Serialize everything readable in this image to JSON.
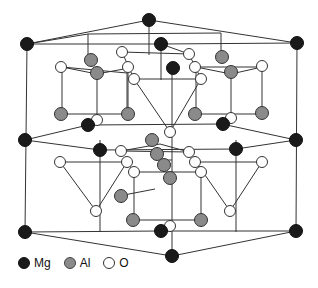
{
  "colors": {
    "Mg": "#1a1a1a",
    "Al": "#8a8a8a",
    "O": "#ffffff",
    "bond": "#333333",
    "outline": "#333333"
  },
  "legend": [
    {
      "key": "Mg",
      "label": "Mg"
    },
    {
      "key": "Al",
      "label": "Al"
    },
    {
      "key": "O",
      "label": "O"
    }
  ],
  "lines": [
    [
      27,
      44,
      149,
      20
    ],
    [
      149,
      20,
      297,
      43
    ],
    [
      27,
      44,
      161,
      44
    ],
    [
      161,
      44,
      297,
      43
    ],
    [
      27,
      44,
      25,
      232
    ],
    [
      297,
      43,
      296,
      231
    ],
    [
      149,
      20,
      149,
      55
    ],
    [
      161,
      44,
      161,
      80
    ],
    [
      27,
      44,
      88,
      34
    ],
    [
      88,
      34,
      88,
      60
    ],
    [
      88,
      34,
      221,
      33
    ],
    [
      221,
      33,
      221,
      55
    ],
    [
      161,
      44,
      189,
      54
    ],
    [
      25,
      232,
      172,
      256
    ],
    [
      172,
      256,
      296,
      231
    ],
    [
      25,
      232,
      161,
      231
    ],
    [
      161,
      231,
      296,
      231
    ],
    [
      172,
      256,
      172,
      140
    ],
    [
      25,
      140,
      88,
      125
    ],
    [
      88,
      125,
      222,
      124
    ],
    [
      222,
      124,
      296,
      140
    ],
    [
      25,
      140,
      100,
      150
    ],
    [
      100,
      150,
      236,
      149
    ],
    [
      236,
      149,
      296,
      140
    ],
    [
      100,
      140,
      100,
      232
    ],
    [
      236,
      140,
      236,
      232
    ],
    [
      62,
      67,
      97,
      74
    ],
    [
      97,
      74,
      129,
      68
    ],
    [
      62,
      67,
      127,
      73
    ],
    [
      62,
      67,
      62,
      114
    ],
    [
      62,
      114,
      127,
      114
    ],
    [
      127,
      73,
      127,
      114
    ],
    [
      97,
      74,
      97,
      120
    ],
    [
      128,
      68,
      128,
      114
    ],
    [
      196,
      67,
      231,
      74
    ],
    [
      231,
      74,
      262,
      67
    ],
    [
      196,
      67,
      262,
      67
    ],
    [
      262,
      67,
      262,
      114
    ],
    [
      196,
      67,
      196,
      114
    ],
    [
      196,
      114,
      262,
      114
    ],
    [
      231,
      74,
      231,
      118
    ],
    [
      134,
      79,
      201,
      79
    ],
    [
      134,
      79,
      170,
      132
    ],
    [
      201,
      79,
      170,
      132
    ],
    [
      172,
      70,
      172,
      140
    ],
    [
      122,
      52,
      189,
      54
    ],
    [
      122,
      52,
      134,
      79
    ],
    [
      189,
      54,
      201,
      79
    ],
    [
      60,
      162,
      127,
      162
    ],
    [
      60,
      162,
      96,
      211
    ],
    [
      127,
      162,
      96,
      211
    ],
    [
      127,
      162,
      134,
      172
    ],
    [
      196,
      162,
      262,
      162
    ],
    [
      196,
      162,
      230,
      211
    ],
    [
      262,
      162,
      230,
      211
    ],
    [
      196,
      162,
      201,
      172
    ],
    [
      134,
      172,
      201,
      172
    ],
    [
      134,
      172,
      134,
      220
    ],
    [
      201,
      172,
      201,
      220
    ],
    [
      134,
      220,
      201,
      220
    ],
    [
      121,
      151,
      189,
      152
    ],
    [
      121,
      151,
      160,
      144
    ],
    [
      160,
      144,
      189,
      152
    ],
    [
      161,
      160,
      172,
      160
    ],
    [
      155,
      189,
      124,
      195
    ]
  ],
  "atoms": [
    {
      "t": "Mg",
      "x": 149,
      "y": 20
    },
    {
      "t": "Mg",
      "x": 27,
      "y": 44
    },
    {
      "t": "Mg",
      "x": 161,
      "y": 44
    },
    {
      "t": "Mg",
      "x": 297,
      "y": 43
    },
    {
      "t": "Al",
      "x": 91,
      "y": 60
    },
    {
      "t": "Al",
      "x": 222,
      "y": 57
    },
    {
      "t": "O",
      "x": 122,
      "y": 52
    },
    {
      "t": "O",
      "x": 189,
      "y": 54
    },
    {
      "t": "O",
      "x": 61,
      "y": 67
    },
    {
      "t": "O",
      "x": 128,
      "y": 67
    },
    {
      "t": "O",
      "x": 195,
      "y": 67
    },
    {
      "t": "O",
      "x": 262,
      "y": 66
    },
    {
      "t": "Mg",
      "x": 173,
      "y": 68
    },
    {
      "t": "Al",
      "x": 97,
      "y": 73
    },
    {
      "t": "Al",
      "x": 231,
      "y": 72
    },
    {
      "t": "O",
      "x": 134,
      "y": 79
    },
    {
      "t": "O",
      "x": 201,
      "y": 79
    },
    {
      "t": "Al",
      "x": 61,
      "y": 114
    },
    {
      "t": "Al",
      "x": 128,
      "y": 114
    },
    {
      "t": "Al",
      "x": 195,
      "y": 114
    },
    {
      "t": "Al",
      "x": 262,
      "y": 113
    },
    {
      "t": "O",
      "x": 97,
      "y": 120
    },
    {
      "t": "O",
      "x": 231,
      "y": 118
    },
    {
      "t": "Mg",
      "x": 88,
      "y": 125
    },
    {
      "t": "Mg",
      "x": 223,
      "y": 124
    },
    {
      "t": "O",
      "x": 170,
      "y": 132
    },
    {
      "t": "Al",
      "x": 152,
      "y": 140
    },
    {
      "t": "Mg",
      "x": 25,
      "y": 140
    },
    {
      "t": "Mg",
      "x": 296,
      "y": 140
    },
    {
      "t": "Mg",
      "x": 100,
      "y": 150
    },
    {
      "t": "Mg",
      "x": 236,
      "y": 149
    },
    {
      "t": "O",
      "x": 121,
      "y": 151
    },
    {
      "t": "O",
      "x": 189,
      "y": 152
    },
    {
      "t": "Al",
      "x": 157,
      "y": 154
    },
    {
      "t": "O",
      "x": 60,
      "y": 162
    },
    {
      "t": "O",
      "x": 127,
      "y": 162
    },
    {
      "t": "O",
      "x": 195,
      "y": 162
    },
    {
      "t": "O",
      "x": 262,
      "y": 162
    },
    {
      "t": "Al",
      "x": 164,
      "y": 165
    },
    {
      "t": "O",
      "x": 134,
      "y": 172
    },
    {
      "t": "O",
      "x": 201,
      "y": 172
    },
    {
      "t": "Al",
      "x": 170,
      "y": 178
    },
    {
      "t": "Al",
      "x": 121,
      "y": 196
    },
    {
      "t": "O",
      "x": 96,
      "y": 211
    },
    {
      "t": "O",
      "x": 230,
      "y": 211
    },
    {
      "t": "Al",
      "x": 133,
      "y": 220
    },
    {
      "t": "Al",
      "x": 201,
      "y": 220
    },
    {
      "t": "O",
      "x": 170,
      "y": 226
    },
    {
      "t": "Mg",
      "x": 25,
      "y": 232
    },
    {
      "t": "Mg",
      "x": 161,
      "y": 231
    },
    {
      "t": "Mg",
      "x": 296,
      "y": 231
    },
    {
      "t": "Mg",
      "x": 172,
      "y": 256
    }
  ]
}
